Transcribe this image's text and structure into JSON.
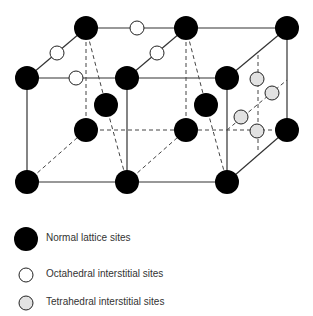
{
  "diagram": {
    "type": "crystal-lattice-interstitial-sites",
    "colors": {
      "normal": "#000000",
      "octahedral": "#ffffff",
      "tetrahedral": "#e2e2e2",
      "line": "#333333"
    }
  },
  "legend": {
    "items": [
      {
        "label": "Normal lattice sites",
        "symbol": "black-filled-circle"
      },
      {
        "label": "Octahedral interstitial sites",
        "symbol": "white-circle"
      },
      {
        "label": "Tetrahedral interstitial sites",
        "symbol": "gray-circle"
      }
    ]
  }
}
